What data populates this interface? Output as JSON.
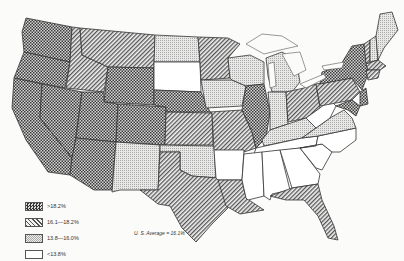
{
  "map": {
    "title": "",
    "subject": "United States by state, percentage categories",
    "legend": [
      {
        "label": ">18.2%",
        "pattern": "dense-checker",
        "color": "#444444"
      },
      {
        "label": "16.1—18.2%",
        "pattern": "diagonal-hatch",
        "color": "#777777"
      },
      {
        "label": "13.8—16.0%",
        "pattern": "light-dots",
        "color": "#bbbbbb"
      },
      {
        "label": "<13.8%",
        "pattern": "blank",
        "color": "#ffffff"
      }
    ],
    "average_label": "U. S. Average = 16.1%",
    "categories": {
      "above_18_2": [
        "Washington",
        "Oregon",
        "California",
        "Nevada",
        "Utah",
        "Arizona",
        "Wyoming",
        "Colorado",
        "Nebraska",
        "Illinois",
        "New York",
        "New Jersey",
        "Delaware",
        "Maryland"
      ],
      "16_1_to_18_2": [
        "Idaho",
        "Montana",
        "Minnesota",
        "Kansas",
        "Missouri",
        "Texas",
        "Louisiana",
        "Florida",
        "Ohio",
        "Pennsylvania",
        "Massachusetts",
        "Connecticut",
        "Rhode Island",
        "Vermont"
      ],
      "13_8_to_16_0": [
        "North Dakota",
        "Iowa",
        "Wisconsin",
        "New Mexico",
        "Oklahoma",
        "Indiana",
        "Kentucky",
        "Michigan",
        "Maine",
        "New Hampshire",
        "Virginia"
      ],
      "below_13_8": [
        "South Dakota",
        "Arkansas",
        "Mississippi",
        "Alabama",
        "Georgia",
        "Tennessee",
        "North Carolina",
        "South Carolina",
        "West Virginia"
      ]
    }
  }
}
